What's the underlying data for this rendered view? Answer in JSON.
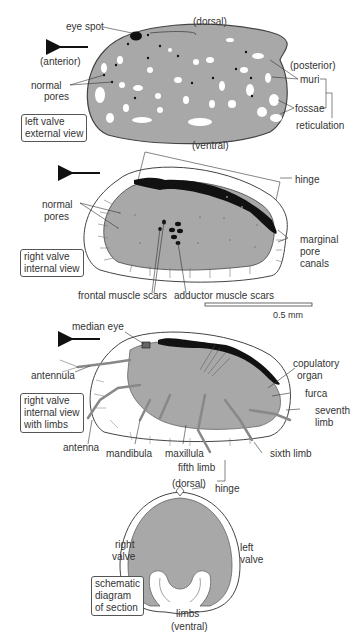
{
  "figure": {
    "colors": {
      "fill": "#a8a8a8",
      "outline": "#444444",
      "dark": "#111111",
      "paper": "#ffffff"
    },
    "panel1": {
      "box_label": [
        "left valve",
        "external view"
      ],
      "labels": {
        "eye_spot": "eye spot",
        "dorsal": "(dorsal)",
        "anterior": "(anterior)",
        "posterior": "(posterior)",
        "normal_pores": [
          "normal",
          "pores"
        ],
        "muri": "muri",
        "fossae": "fossae",
        "reticulation": "reticulation",
        "ventral": "(ventral)"
      }
    },
    "panel2": {
      "box_label": [
        "right valve",
        "internal view"
      ],
      "labels": {
        "hinge": "hinge",
        "normal_pores": [
          "normal",
          "pores"
        ],
        "marginal_pore_canals": [
          "marginal",
          "pore",
          "canals"
        ],
        "frontal_muscle_scars": "frontal muscle scars",
        "adductor_muscle_scars": "adductor muscle scars"
      },
      "scale_bar": "0.5 mm"
    },
    "panel3": {
      "box_label": [
        "right valve",
        "internal view",
        "with limbs"
      ],
      "labels": {
        "median_eye": "median eye",
        "antennula": "antennula",
        "copulatory_organ": [
          "copulatory",
          "organ"
        ],
        "furca": "furca",
        "seventh_limb": [
          "seventh",
          "limb"
        ],
        "antenna": "antenna",
        "mandibula": "mandibula",
        "maxillula": "maxillula",
        "fifth_limb": "fifth limb",
        "sixth_limb": "sixth limb"
      }
    },
    "panel4": {
      "box_label": [
        "schematic",
        "diagram",
        "of section"
      ],
      "labels": {
        "dorsal": "(dorsal)",
        "hinge": "hinge",
        "right_valve": [
          "right",
          "valve"
        ],
        "left_valve": [
          "left",
          "valve"
        ],
        "limbs": "limbs",
        "ventral": "(ventral)"
      }
    }
  }
}
